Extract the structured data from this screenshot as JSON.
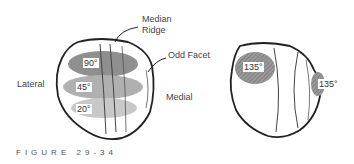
{
  "labels": {
    "median_ridge_1": "Median",
    "median_ridge_2": "Ridge",
    "odd_facet": "Odd Facet",
    "lateral": "Lateral",
    "medial": "Medial"
  },
  "left_patella": {
    "contact_zones": [
      {
        "angle": "90°",
        "shade": "#8a8a8a"
      },
      {
        "angle": "45°",
        "shade": "#a8a8a8"
      },
      {
        "angle": "20°",
        "shade": "#c4c4c4"
      }
    ]
  },
  "right_patella": {
    "contact_zones": [
      {
        "angle": "135°",
        "position": "lateral"
      },
      {
        "angle": "135°",
        "position": "odd-facet"
      }
    ]
  },
  "caption": "FIGURE 29-34"
}
